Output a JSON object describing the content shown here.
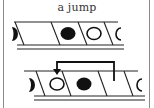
{
  "figure": {
    "title": "a jump",
    "colors": {
      "ink": "#111111",
      "border": "#8a8a8a",
      "background": "#ffffff"
    },
    "tapes": [
      {
        "id": "before",
        "cells": [
          "half-filled-left",
          "empty",
          "filled",
          "hollow",
          "half-hollow-right"
        ]
      },
      {
        "id": "after",
        "cells": [
          "half-filled-left",
          "hollow",
          "filled",
          "empty",
          "half-hollow-right"
        ],
        "arrow": {
          "from_cell": 3,
          "to_cell": 1,
          "direction": "left"
        }
      }
    ]
  }
}
